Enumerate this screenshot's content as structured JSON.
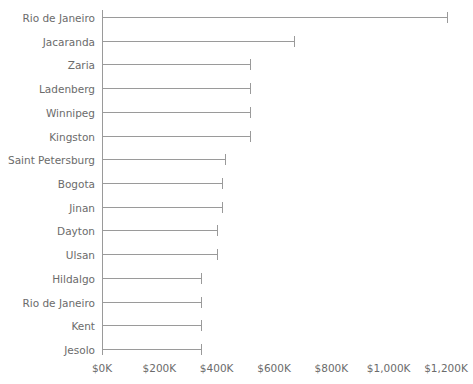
{
  "chart_data": {
    "type": "bar",
    "orientation": "horizontal",
    "title": "",
    "xlabel": "",
    "ylabel": "",
    "xlim": [
      0,
      1200
    ],
    "xtick_labels": [
      "$0K",
      "$200K",
      "$400K",
      "$600K",
      "$800K",
      "$1,000K",
      "$1,200K"
    ],
    "xtick_values": [
      0,
      200,
      400,
      600,
      800,
      1000,
      1200
    ],
    "grid": false,
    "legend": null,
    "units": "thousands of dollars",
    "categories": [
      "Rio de Janeiro",
      "Jacaranda",
      "Zaria",
      "Ladenberg",
      "Winnipeg",
      "Kingston",
      "Saint Petersburg",
      "Bogota",
      "Jinan",
      "Dayton",
      "Ulsan",
      "Hildalgo",
      "Rio de Janeiro",
      "Kent",
      "Jesolo"
    ],
    "values": [
      1203,
      670,
      516,
      516,
      516,
      516,
      429,
      418,
      418,
      401,
      401,
      345,
      345,
      345,
      345
    ],
    "series": [
      {
        "name": "value",
        "values": [
          1203,
          670,
          516,
          516,
          516,
          516,
          429,
          418,
          418,
          401,
          401,
          345,
          345,
          345,
          345
        ]
      }
    ],
    "colors": {
      "bar": "#9a9a9a",
      "axis": "#9a9a9a",
      "text": "#6b6b6b",
      "background": "#ffffff"
    }
  },
  "axis": {
    "x_labels": [
      "$0K",
      "$200K",
      "$400K",
      "$600K",
      "$800K",
      "$1,000K",
      "$1,200K"
    ]
  }
}
